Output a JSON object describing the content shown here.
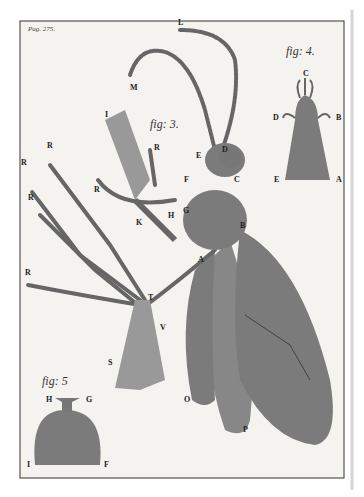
{
  "page": {
    "header": "Pag. 275."
  },
  "figures": [
    {
      "id": "fig3",
      "caption": "fig: 3.",
      "labels": [
        "A",
        "B",
        "C",
        "D",
        "E",
        "F",
        "G",
        "H",
        "I",
        "K",
        "L",
        "M",
        "R",
        "R",
        "R",
        "R",
        "R",
        "R",
        "S",
        "T",
        "V",
        "O",
        "P"
      ]
    },
    {
      "id": "fig4",
      "caption": "fig: 4.",
      "labels": [
        "C",
        "D",
        "B",
        "E",
        "A"
      ]
    },
    {
      "id": "fig5",
      "caption": "fig: 5",
      "labels": [
        "H",
        "G",
        "I",
        "F"
      ]
    }
  ],
  "labels": {
    "A": "A",
    "B": "B",
    "C": "C",
    "D": "D",
    "E": "E",
    "F": "F",
    "G": "G",
    "H": "H",
    "I": "I",
    "K": "K",
    "L": "L",
    "M": "M",
    "R": "R",
    "S": "S",
    "T": "T",
    "V": "V",
    "O": "O",
    "P": "P"
  },
  "colors": {
    "paper": "#f4f3f0",
    "ink": "#3a3a3a",
    "shade": "#777"
  }
}
